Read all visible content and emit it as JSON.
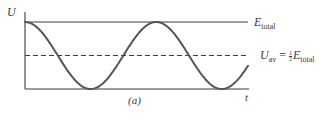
{
  "figure": {
    "caption": "(a)",
    "y_axis_label": "U",
    "x_axis_label": "t",
    "lines": {
      "top": {
        "label_symbol": "E",
        "label_subscript": "total"
      },
      "average": {
        "label_symbol": "U",
        "label_subscript": "av",
        "equals": "=",
        "fraction_numerator": "1",
        "fraction_denominator": "2",
        "rhs_symbol": "E",
        "rhs_subscript": "total",
        "style": "dashed"
      }
    },
    "colors": {
      "ink": "#3a3a3a",
      "curve": "#555555",
      "background": "#ffffff"
    }
  },
  "chart_data": {
    "type": "line",
    "title": "",
    "xlabel": "t",
    "ylabel": "U",
    "caption": "(a)",
    "function": "U(t) = E_total * cos^2(omega t)",
    "ylim": [
      0,
      1
    ],
    "y_units": "fraction of E_total",
    "reference_lines": [
      {
        "name": "E_total",
        "y": 1.0,
        "style": "solid"
      },
      {
        "name": "U_av = 1/2 E_total",
        "y": 0.5,
        "style": "dashed"
      }
    ],
    "key_points": [
      {
        "phase": "t=0",
        "U": 1.0
      },
      {
        "phase": "first minimum",
        "U": 0.0
      },
      {
        "phase": "maximum",
        "U": 1.0
      },
      {
        "phase": "second minimum",
        "U": 0.0
      },
      {
        "phase": "end",
        "U": 0.15
      }
    ],
    "periods_shown": 1.7,
    "grid": false,
    "legend": "none"
  }
}
